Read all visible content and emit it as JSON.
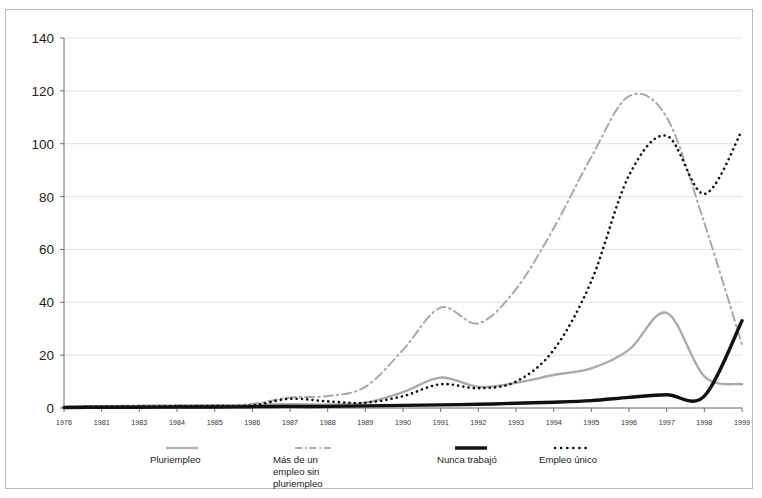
{
  "chart_data": {
    "type": "line",
    "title": "",
    "subtitle": "",
    "xlabel": "",
    "ylabel": "",
    "ylim": [
      0,
      140
    ],
    "ytick_step": 20,
    "ytick_labels": [
      "0",
      "20",
      "40",
      "60",
      "80",
      "100",
      "120",
      "140"
    ],
    "grid": true,
    "grid_axis": "y",
    "legend_position": "bottom",
    "categories": [
      "1976",
      "1981",
      "1983",
      "1984",
      "1985",
      "1986",
      "1987",
      "1988",
      "1989",
      "1990",
      "1991",
      "1992",
      "1993",
      "1994",
      "1995",
      "1996",
      "1997",
      "1998",
      "1999"
    ],
    "x": [
      "1976",
      "1981",
      "1983",
      "1984",
      "1985",
      "1986",
      "1987",
      "1988",
      "1989",
      "1990",
      "1991",
      "1992",
      "1993",
      "1994",
      "1995",
      "1996",
      "1997",
      "1998",
      "1999"
    ],
    "series": [
      {
        "name": "Pluriempleo",
        "style": "solid",
        "color": "#aaaaaa",
        "width": 2.4,
        "values": [
          0.3,
          0.6,
          0.8,
          0.9,
          1.0,
          1.2,
          1.4,
          1.3,
          2.0,
          6.0,
          11.5,
          8.0,
          9.5,
          12.5,
          15.0,
          22.0,
          36.0,
          12.0,
          9.0
        ]
      },
      {
        "name": "Más de un empleo sin pluriempleo",
        "style": "dashdot",
        "color": "#a8a8a8",
        "width": 2.0,
        "values": [
          0.4,
          0.7,
          0.9,
          1.0,
          1.1,
          1.5,
          4.0,
          4.5,
          8.0,
          22.0,
          38.0,
          32.0,
          45.0,
          68.0,
          95.0,
          118.0,
          110.0,
          70.0,
          24.0
        ]
      },
      {
        "name": "Nunca trabajó",
        "style": "solid",
        "color": "#111111",
        "width": 3.4,
        "values": [
          0.2,
          0.3,
          0.3,
          0.4,
          0.4,
          0.5,
          0.6,
          0.6,
          0.8,
          1.0,
          1.2,
          1.4,
          1.8,
          2.2,
          2.8,
          4.0,
          5.0,
          4.5,
          33.0
        ]
      },
      {
        "name": "Empleo único",
        "style": "dotted",
        "color": "#111111",
        "width": 2.6,
        "values": [
          0.3,
          0.5,
          0.6,
          0.7,
          0.8,
          1.0,
          3.5,
          2.5,
          2.0,
          4.5,
          9.0,
          7.5,
          10.0,
          22.0,
          48.0,
          88.0,
          103.0,
          81.0,
          105.0
        ]
      }
    ]
  },
  "axes": {
    "y_ticks": [
      "140",
      "120",
      "100",
      "80",
      "60",
      "40",
      "20",
      "0"
    ],
    "x_ticks": [
      "1976",
      "1981",
      "1983",
      "1984",
      "1985",
      "1986",
      "1987",
      "1988",
      "1989",
      "1990",
      "1991",
      "1992",
      "1993",
      "1994",
      "1995",
      "1996",
      "1997",
      "1998",
      "1999"
    ]
  },
  "legend": {
    "items": [
      {
        "label": "Pluriempleo",
        "style": "solid-gray",
        "color": "#aaaaaa"
      },
      {
        "label": "Más de un empleo sin\npluriempleo",
        "style": "dashdot-gray",
        "color": "#a8a8a8"
      },
      {
        "label": "Nunca trabajó",
        "style": "solid-black",
        "color": "#111111"
      },
      {
        "label": "Empleo único",
        "style": "dotted-black",
        "color": "#111111"
      }
    ]
  }
}
